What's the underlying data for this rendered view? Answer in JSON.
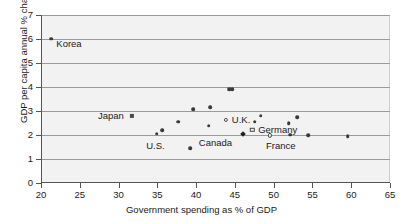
{
  "chart_data": {
    "type": "scatter",
    "title": "",
    "xlabel": "Government spending as % of GDP",
    "ylabel": "GDP per capita annual % change",
    "xlim": [
      20,
      65
    ],
    "ylim": [
      0,
      7
    ],
    "xticks": [
      20,
      25,
      30,
      35,
      40,
      45,
      50,
      55,
      60,
      65
    ],
    "yticks": [
      0,
      1,
      2,
      3,
      4,
      5,
      6,
      7
    ],
    "grid": "horizontal",
    "legend": "none",
    "points": [
      {
        "label": "Korea",
        "x": 21.2,
        "y": 6.02,
        "marker": "filled-circle",
        "label_dx": 5,
        "label_dy": 5
      },
      {
        "label": "Japan",
        "x": 31.6,
        "y": 2.78,
        "marker": "square",
        "label_dx": -34,
        "label_dy": 0
      },
      {
        "label": "",
        "x": 34.8,
        "y": 2.06,
        "marker": "filled-circle",
        "label_dx": 0,
        "label_dy": 0
      },
      {
        "label": "U.S.",
        "x": 35.5,
        "y": 2.19,
        "marker": "filled-circle",
        "label_dx": -16,
        "label_dy": 16
      },
      {
        "label": "",
        "x": 37.6,
        "y": 2.56,
        "marker": "filled-circle",
        "label_dx": 0,
        "label_dy": 0
      },
      {
        "label": "",
        "x": 39.1,
        "y": 1.45,
        "marker": "filled-circle",
        "label_dx": 0,
        "label_dy": 0
      },
      {
        "label": "",
        "x": 39.5,
        "y": 3.07,
        "marker": "filled-circle",
        "label_dx": 0,
        "label_dy": 0
      },
      {
        "label": "",
        "x": 41.5,
        "y": 2.38,
        "marker": "filled-circle",
        "label_dx": 0,
        "label_dy": 0
      },
      {
        "label": "",
        "x": 41.7,
        "y": 3.16,
        "marker": "filled-circle",
        "label_dx": 0,
        "label_dy": 0
      },
      {
        "label": "U.K.",
        "x": 43.7,
        "y": 2.62,
        "marker": "open-circle",
        "label_dx": 6,
        "label_dy": 0
      },
      {
        "label": "",
        "x": 44.1,
        "y": 3.9,
        "marker": "filled-circle",
        "label_dx": 0,
        "label_dy": 0
      },
      {
        "label": "",
        "x": 44.5,
        "y": 3.9,
        "marker": "filled-circle",
        "label_dx": 0,
        "label_dy": 0
      },
      {
        "label": "Canada",
        "x": 45.9,
        "y": 2.03,
        "marker": "diamond",
        "label_dx": -44,
        "label_dy": 9
      },
      {
        "label": "Germany",
        "x": 47.1,
        "y": 2.21,
        "marker": "open-square",
        "label_dx": 6,
        "label_dy": 0
      },
      {
        "label": "",
        "x": 47.4,
        "y": 2.56,
        "marker": "filled-circle",
        "label_dx": 0,
        "label_dy": 0
      },
      {
        "label": "",
        "x": 48.2,
        "y": 2.8,
        "marker": "filled-circle",
        "label_dx": 0,
        "label_dy": 0
      },
      {
        "label": "France",
        "x": 49.4,
        "y": 1.98,
        "marker": "open-circle",
        "label_dx": -4,
        "label_dy": 11
      },
      {
        "label": "",
        "x": 51.8,
        "y": 2.5,
        "marker": "filled-circle",
        "label_dx": 0,
        "label_dy": 0
      },
      {
        "label": "",
        "x": 52.0,
        "y": 2.02,
        "marker": "filled-circle",
        "label_dx": 0,
        "label_dy": 0
      },
      {
        "label": "",
        "x": 52.9,
        "y": 2.73,
        "marker": "filled-circle",
        "label_dx": 0,
        "label_dy": 0
      },
      {
        "label": "",
        "x": 54.3,
        "y": 1.98,
        "marker": "filled-circle",
        "label_dx": 0,
        "label_dy": 0
      },
      {
        "label": "",
        "x": 59.4,
        "y": 1.96,
        "marker": "filled-circle",
        "label_dx": 0,
        "label_dy": 0
      }
    ]
  },
  "colors": {
    "plot_background": "#f2f2f2",
    "gridline": "#9a9a9a",
    "axis": "#555555",
    "marker": "#3a3a3a",
    "text": "#1a1a1a"
  }
}
